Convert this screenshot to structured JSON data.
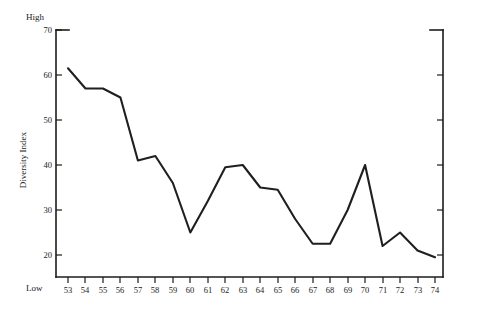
{
  "chart_data": {
    "type": "line",
    "title": "",
    "xlabel": "",
    "ylabel": "Diversity Index",
    "x": [
      53,
      54,
      55,
      56,
      57,
      58,
      59,
      60,
      61,
      62,
      63,
      64,
      65,
      66,
      67,
      68,
      69,
      70,
      71,
      72,
      73,
      74
    ],
    "categories": [
      "53",
      "54",
      "55",
      "56",
      "57",
      "58",
      "59",
      "60",
      "61",
      "62",
      "63",
      "64",
      "65",
      "66",
      "67",
      "68",
      "69",
      "70",
      "71",
      "72",
      "73",
      "74"
    ],
    "values": [
      61.5,
      57,
      57,
      55,
      41,
      42,
      36,
      25,
      32,
      39.5,
      40,
      35,
      34.5,
      28,
      22.5,
      22.5,
      30,
      40,
      22,
      25,
      21,
      19.5
    ],
    "ylim": [
      15,
      70
    ],
    "xlim": [
      53,
      74
    ],
    "yticks": [
      20,
      30,
      40,
      50,
      60,
      70
    ],
    "ytick_labels": [
      "20",
      "30",
      "40",
      "50",
      "60",
      "70"
    ],
    "grid": false,
    "legend": null,
    "annotations": {
      "y_axis_high": "High",
      "y_axis_low": "Low"
    },
    "line_color": "#1f1f1f",
    "axis_color": "#1c1c1c",
    "background_color": "#ffffff"
  },
  "axes": {
    "y_title": "Diversity Index",
    "high_label": "High",
    "low_label": "Low"
  }
}
